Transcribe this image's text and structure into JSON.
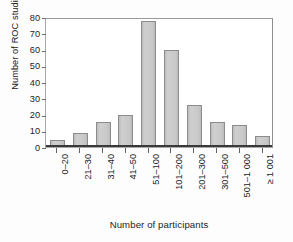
{
  "chart_data": {
    "type": "bar",
    "title": "",
    "subtitle": "",
    "xlabel": "Number of participants",
    "ylabel": "Number of ROC studies",
    "categories": [
      "0–20",
      "21–30",
      "31–40",
      "41–50",
      "51–100",
      "101–200",
      "201–300",
      "301–500",
      "501–1 000",
      "≥ 1 001"
    ],
    "values": [
      4,
      8,
      15,
      19,
      77,
      59,
      25,
      15,
      13,
      6
    ],
    "ylim": [
      0,
      80
    ],
    "ytick_labels": [
      "0",
      "10",
      "20",
      "30",
      "40",
      "50",
      "60",
      "70",
      "80"
    ],
    "ytick_values": [
      0,
      10,
      20,
      30,
      40,
      50,
      60,
      70,
      80
    ],
    "grid": "off",
    "legend": "none",
    "bar_fill_color": "#c9c9c9",
    "bar_border_color": "#8c8c8c",
    "axis_color": "#3a3a3a",
    "frame_color": "#a9a9a9",
    "text_color": "#232323"
  }
}
